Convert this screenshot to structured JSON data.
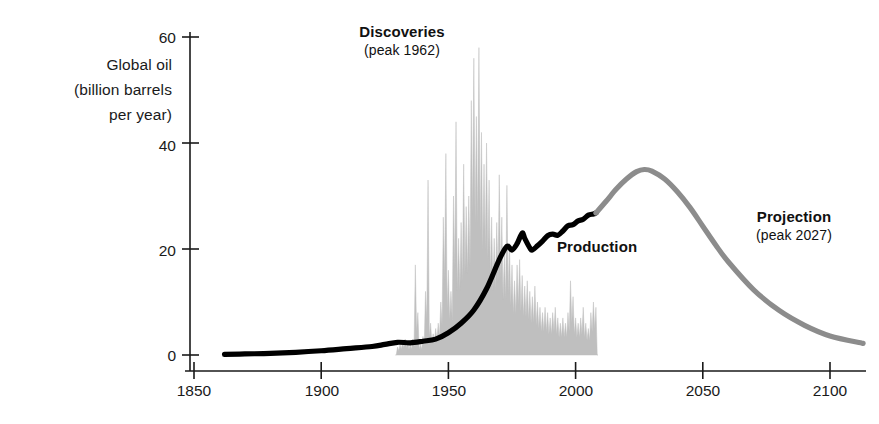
{
  "chart_data": {
    "type": "area",
    "title": "",
    "xlabel": "",
    "ylabel": "Global oil (billion barrels per year)",
    "ylabel_lines": [
      "Global oil",
      "(billion barrels",
      "per year)"
    ],
    "xlim": [
      1850,
      2115
    ],
    "ylim": [
      0,
      60
    ],
    "xticks": [
      1850,
      1900,
      1950,
      2000,
      2050,
      2100
    ],
    "xtick_labels": [
      "1850",
      "1900",
      "1950",
      "2000",
      "2050",
      "2100"
    ],
    "yticks": [
      0,
      20,
      40,
      60
    ],
    "ytick_labels": [
      "0",
      "20",
      "40",
      "60"
    ],
    "grid": false,
    "legend_position": "in-plot annotations",
    "colors": {
      "discoveries_fill": "#bfbfbf",
      "production_line": "#000000",
      "projection_line": "#8c8c8c",
      "axis": "#1a1a1a",
      "text": "#1a1a1a"
    },
    "annotations": [
      {
        "name": "discoveries",
        "title": "Discoveries",
        "subtitle": "(peak 1962)",
        "peak_year": 1962
      },
      {
        "name": "production",
        "title": "Production",
        "subtitle": ""
      },
      {
        "name": "projection",
        "title": "Projection",
        "subtitle": "(peak 2027)",
        "peak_year": 2027
      }
    ],
    "series": [
      {
        "name": "Discoveries",
        "type": "area",
        "color": "#bfbfbf",
        "x": [
          1930,
          1931,
          1932,
          1933,
          1934,
          1935,
          1936,
          1937,
          1938,
          1939,
          1940,
          1941,
          1942,
          1943,
          1944,
          1945,
          1946,
          1947,
          1948,
          1949,
          1950,
          1951,
          1952,
          1953,
          1954,
          1955,
          1956,
          1957,
          1958,
          1959,
          1960,
          1961,
          1962,
          1963,
          1964,
          1965,
          1966,
          1967,
          1968,
          1969,
          1970,
          1971,
          1972,
          1973,
          1974,
          1975,
          1976,
          1977,
          1978,
          1979,
          1980,
          1981,
          1982,
          1983,
          1984,
          1985,
          1986,
          1987,
          1988,
          1989,
          1990,
          1991,
          1992,
          1993,
          1994,
          1995,
          1996,
          1997,
          1998,
          1999,
          2000,
          2001,
          2002,
          2003,
          2004,
          2005,
          2006,
          2007,
          2008
        ],
        "values": [
          1.5,
          2.0,
          2.5,
          3.0,
          2.5,
          2.0,
          3.0,
          17.0,
          8.0,
          2.0,
          3.5,
          12.0,
          33.0,
          6.0,
          4.0,
          5.0,
          6.0,
          10.0,
          26.0,
          38.0,
          16.0,
          12.0,
          30.0,
          44.0,
          22.0,
          25.0,
          36.0,
          28.0,
          30.0,
          48.0,
          56.0,
          45.0,
          58.0,
          42.0,
          36.0,
          40.0,
          33.0,
          26.0,
          22.0,
          25.0,
          34.0,
          26.0,
          19.0,
          32.0,
          21.0,
          17.0,
          14.0,
          17.0,
          18.0,
          15.0,
          13.0,
          14.0,
          12.0,
          11.0,
          13.0,
          10.0,
          9.0,
          8.0,
          9.0,
          8.0,
          7.0,
          8.0,
          9.0,
          7.0,
          6.0,
          7.0,
          6.0,
          8.0,
          14.0,
          11.0,
          7.0,
          6.0,
          7.0,
          9.0,
          6.0,
          5.0,
          8.0,
          10.0,
          9.0
        ]
      },
      {
        "name": "Production",
        "type": "line",
        "color": "#000000",
        "x": [
          1862,
          1870,
          1880,
          1890,
          1900,
          1910,
          1920,
          1925,
          1930,
          1935,
          1940,
          1945,
          1950,
          1955,
          1960,
          1965,
          1970,
          1973,
          1975,
          1977,
          1979,
          1980,
          1982,
          1983,
          1985,
          1987,
          1989,
          1991,
          1993,
          1995,
          1997,
          1999,
          2001,
          2003,
          2005,
          2007,
          2008
        ],
        "values": [
          0.1,
          0.2,
          0.3,
          0.5,
          0.8,
          1.2,
          1.6,
          2.0,
          2.4,
          2.3,
          2.6,
          3.0,
          4.2,
          6.0,
          8.5,
          12.5,
          18.0,
          20.5,
          19.8,
          21.0,
          23.0,
          22.0,
          20.2,
          19.8,
          20.6,
          21.5,
          22.5,
          22.8,
          22.6,
          23.4,
          24.4,
          24.6,
          25.3,
          25.6,
          26.4,
          26.6,
          26.8
        ]
      },
      {
        "name": "Projection",
        "type": "line",
        "color": "#8c8c8c",
        "x": [
          2008,
          2012,
          2016,
          2020,
          2024,
          2027,
          2030,
          2035,
          2040,
          2045,
          2050,
          2055,
          2060,
          2070,
          2080,
          2090,
          2100,
          2113
        ],
        "values": [
          26.8,
          29.0,
          31.3,
          33.2,
          34.6,
          35.0,
          34.7,
          33.2,
          30.8,
          27.8,
          24.3,
          20.8,
          17.6,
          12.3,
          8.4,
          5.6,
          3.6,
          2.2
        ]
      }
    ]
  }
}
